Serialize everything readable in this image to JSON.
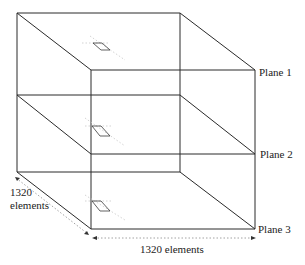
{
  "diagram": {
    "title": "",
    "planes": [
      {
        "label": "Plane 1"
      },
      {
        "label": "Plane 2"
      },
      {
        "label": "Plane 3"
      }
    ],
    "dimension_depth": {
      "value": "1320",
      "unit": "elements"
    },
    "dimension_width": {
      "label": "1320 elements"
    },
    "colors": {
      "edge": "#2a2a2a",
      "dimension": "#8a8a8a",
      "background": "#ffffff"
    }
  }
}
